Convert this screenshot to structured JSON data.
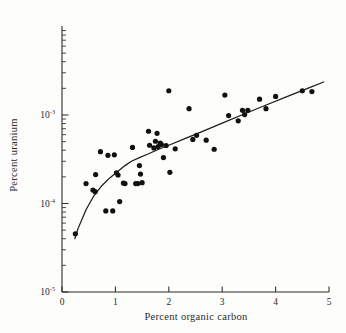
{
  "chart_data": {
    "type": "scatter",
    "title": "",
    "xlabel": "Percent organic carbon",
    "ylabel": "Percent uranium",
    "xlim": [
      0,
      5
    ],
    "ylim": [
      1e-05,
      0.003
    ],
    "yscale": "log",
    "xscale": "linear",
    "grid": false,
    "legend": null,
    "xticks": [
      0,
      1,
      2,
      3,
      4,
      5
    ],
    "xtick_labels": [
      "0",
      "1",
      "2",
      "3",
      "4",
      "5"
    ],
    "yticks": [
      1e-05,
      0.0001,
      0.001
    ],
    "ytick_labels": [
      "10-5",
      "10-4",
      "10-3"
    ],
    "ytick_mantissa": "10",
    "ytick_exponents": [
      "-5",
      "-4",
      "-3"
    ],
    "marker": "filled-circle",
    "marker_color": "#111111",
    "marker_size_px": 2.6,
    "line_color": "#1c1c1c",
    "axis_color": "#2b2b2b",
    "background_color": "#fdfdfc",
    "points": [
      [
        0.25,
        4.55e-05
      ],
      [
        0.45,
        0.000168
      ],
      [
        0.58,
        0.000142
      ],
      [
        0.62,
        0.000136
      ],
      [
        0.63,
        0.000212
      ],
      [
        0.72,
        0.000385
      ],
      [
        0.82,
        8.25e-05
      ],
      [
        0.86,
        0.00035
      ],
      [
        0.95,
        8.25e-05
      ],
      [
        0.98,
        0.000355
      ],
      [
        1.02,
        0.000222
      ],
      [
        1.05,
        0.00021
      ],
      [
        1.08,
        0.000105
      ],
      [
        1.15,
        0.00017
      ],
      [
        1.18,
        0.000168
      ],
      [
        1.32,
        0.00043
      ],
      [
        1.38,
        0.000168
      ],
      [
        1.42,
        0.000168
      ],
      [
        1.45,
        0.000268
      ],
      [
        1.47,
        0.000215
      ],
      [
        1.5,
        0.000172
      ],
      [
        1.62,
        0.000655
      ],
      [
        1.64,
        0.000455
      ],
      [
        1.72,
        0.000425
      ],
      [
        1.75,
        0.000505
      ],
      [
        1.78,
        0.00062
      ],
      [
        1.8,
        0.00044
      ],
      [
        1.84,
        0.00048
      ],
      [
        1.86,
        0.000465
      ],
      [
        1.9,
        0.00033
      ],
      [
        1.95,
        0.000452
      ],
      [
        2.0,
        0.00188
      ],
      [
        2.02,
        0.000225
      ],
      [
        2.12,
        0.000415
      ],
      [
        2.38,
        0.00118
      ],
      [
        2.45,
        0.00053
      ],
      [
        2.52,
        0.00059
      ],
      [
        2.7,
        0.00052
      ],
      [
        2.85,
        0.00041
      ],
      [
        3.05,
        0.00168
      ],
      [
        3.12,
        0.000985
      ],
      [
        3.3,
        0.00086
      ],
      [
        3.38,
        0.00113
      ],
      [
        3.42,
        0.00101
      ],
      [
        3.48,
        0.00113
      ],
      [
        3.7,
        0.00151
      ],
      [
        3.82,
        0.00118
      ],
      [
        4.0,
        0.00162
      ],
      [
        4.5,
        0.00188
      ],
      [
        4.68,
        0.00184
      ]
    ],
    "fit_curve": {
      "description": "piecewise fitted trend with break near x = 1.3",
      "points": [
        [
          0.24,
          4e-05
        ],
        [
          0.3,
          5.2e-05
        ],
        [
          0.45,
          8.5e-05
        ],
        [
          0.6,
          0.000123
        ],
        [
          0.75,
          0.00016
        ],
        [
          0.9,
          0.000196
        ],
        [
          1.05,
          0.000232
        ],
        [
          1.18,
          0.000268
        ],
        [
          1.3,
          0.0003
        ],
        [
          1.45,
          0.00033
        ],
        [
          1.6,
          0.00036
        ],
        [
          1.8,
          0.000408
        ],
        [
          2.0,
          0.000455
        ],
        [
          2.3,
          0.00054
        ],
        [
          2.6,
          0.00064
        ],
        [
          3.0,
          0.00081
        ],
        [
          3.4,
          0.00102
        ],
        [
          3.8,
          0.00128
        ],
        [
          4.2,
          0.0016
        ],
        [
          4.6,
          0.002
        ],
        [
          4.9,
          0.00236
        ]
      ]
    }
  },
  "axes": {
    "x_title": "Percent organic carbon",
    "y_title": "Percent uranium"
  }
}
